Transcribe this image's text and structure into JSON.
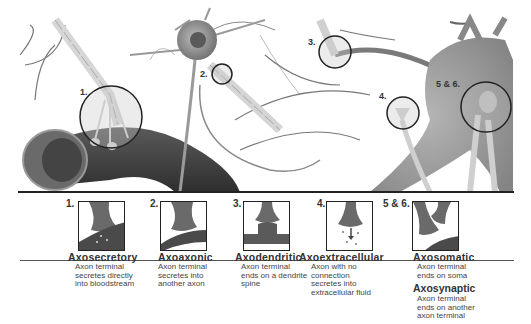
{
  "illustration": {
    "callouts": [
      {
        "id": "1",
        "label": "1."
      },
      {
        "id": "2",
        "label": "2."
      },
      {
        "id": "3",
        "label": "3."
      },
      {
        "id": "4",
        "label": "4."
      },
      {
        "id": "5-6",
        "label": "5 & 6."
      }
    ]
  },
  "panels": [
    {
      "number": "1.",
      "title": "Axosecretory",
      "desc": [
        "Axon terminal",
        "secretes directly",
        "into bloodstream"
      ]
    },
    {
      "number": "2.",
      "title": "Axoaxonic",
      "desc": [
        "Axon terminal",
        "secretes into",
        "another axon"
      ]
    },
    {
      "number": "3.",
      "title": "Axodendritic",
      "desc": [
        "Axon terminal",
        "ends on a dendrite",
        "spine"
      ]
    },
    {
      "number": "4.",
      "title": "Axoextracellular",
      "desc": [
        "Axon with no",
        "connection",
        "secretes into",
        "extracellular fluid"
      ]
    },
    {
      "number": "5 & 6.",
      "title": "Axosomatic",
      "desc": [
        "Axon terminal",
        "ends on soma"
      ],
      "title2": "Axosynaptic",
      "desc2": [
        "Axon terminal",
        "ends on another",
        "axon terminal"
      ]
    }
  ],
  "colors": {
    "line": "#222222",
    "text": "#333333",
    "tissue_dark": "#4a4a4a",
    "tissue_mid": "#8a8a8a",
    "tissue_light": "#c8c8c8"
  }
}
